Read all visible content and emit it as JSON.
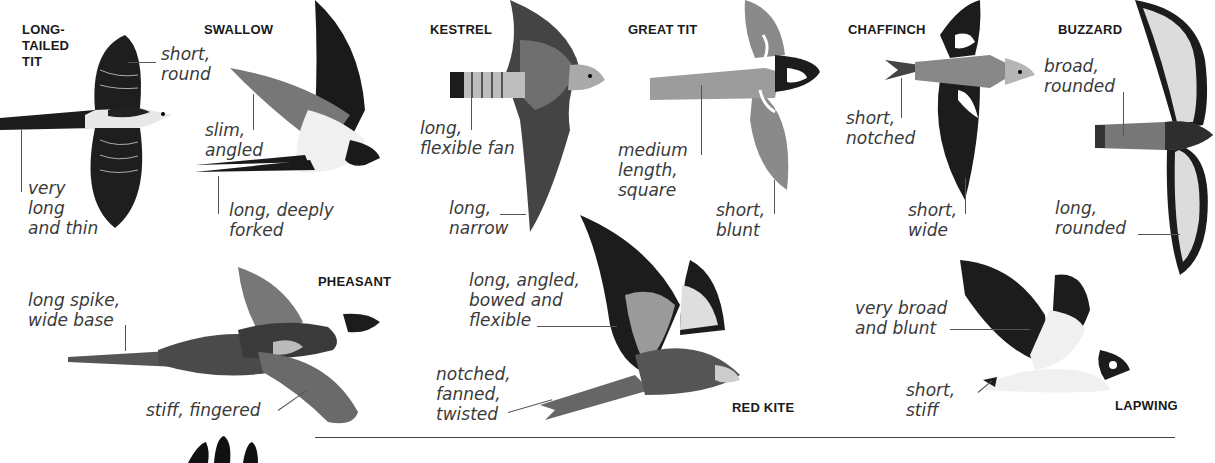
{
  "birds": [
    {
      "name": "LONG-\nTAILED\nTIT",
      "labels": [
        "short,\nround",
        "very\nlong\nand thin"
      ]
    },
    {
      "name": "SWALLOW",
      "labels": [
        "slim,\nangled",
        "long, deeply\nforked"
      ]
    },
    {
      "name": "KESTREL",
      "labels": [
        "long,\nflexible fan",
        "long,\nnarrow"
      ]
    },
    {
      "name": "GREAT TIT",
      "labels": [
        "medium\nlength,\nsquare",
        "short,\nblunt"
      ]
    },
    {
      "name": "CHAFFINCH",
      "labels": [
        "short,\nnotched",
        "short,\nwide"
      ]
    },
    {
      "name": "BUZZARD",
      "labels": [
        "broad,\nrounded",
        "long,\nrounded"
      ]
    },
    {
      "name": "PHEASANT",
      "labels": [
        "long spike,\nwide base",
        "stiff, fingered"
      ]
    },
    {
      "name": "RED KITE",
      "labels": [
        "long, angled,\nbowed and\nflexible",
        "notched,\nfanned,\ntwisted"
      ]
    },
    {
      "name": "LAPWING",
      "labels": [
        "very broad\nand blunt",
        "short,\nstiff"
      ]
    }
  ],
  "colors": {
    "background": "#ffffff",
    "text": "#3a3a3a",
    "title": "#1a1a1a",
    "rule": "#444444"
  }
}
